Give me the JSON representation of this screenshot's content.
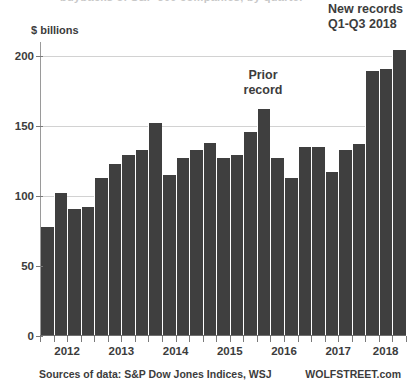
{
  "axis_unit_label": "$ billions",
  "ghost_top_text": "buybacks of S&P 500 companies, by quarter",
  "annotations": {
    "new_records": "New records\nQ1-Q3 2018",
    "new_records_line1": "New records",
    "new_records_line2": "Q1-Q3 2018",
    "prior_record_line1": "Prior",
    "prior_record_line2": "record"
  },
  "footer": {
    "sources": "Sources of data: S&P Dow Jones Indices, WSJ",
    "brand": "WOLFSTREET.com"
  },
  "colors": {
    "bar": "#3f3f3f",
    "grid": "#d2d2d2",
    "axis": "#7a7a7a",
    "text": "#3c3c3c",
    "background": "#ffffff"
  },
  "chart_data": {
    "type": "bar",
    "title": "",
    "subtitle": "",
    "xlabel": "",
    "ylabel": "$ billions",
    "ylim": [
      0,
      210
    ],
    "yticks": [
      0,
      50,
      100,
      150,
      200
    ],
    "ytick_labels": [
      "0",
      "50",
      "100",
      "150",
      "200"
    ],
    "grid": true,
    "legend": false,
    "categories": [
      "2012 Q1",
      "2012 Q2",
      "2012 Q3",
      "2012 Q4",
      "2013 Q1",
      "2013 Q2",
      "2013 Q3",
      "2013 Q4",
      "2014 Q1",
      "2014 Q2",
      "2014 Q3",
      "2014 Q4",
      "2015 Q1",
      "2015 Q2",
      "2015 Q3",
      "2015 Q4",
      "2016 Q1",
      "2016 Q2",
      "2016 Q3",
      "2016 Q4",
      "2017 Q1",
      "2017 Q2",
      "2017 Q3",
      "2017 Q4",
      "2018 Q1",
      "2018 Q2",
      "2018 Q3"
    ],
    "values": [
      78,
      102,
      91,
      92,
      113,
      123,
      129,
      133,
      152,
      115,
      127,
      133,
      138,
      127,
      129,
      146,
      162,
      127,
      113,
      135,
      135,
      117,
      133,
      137,
      189,
      191,
      204
    ],
    "x_tick_year_labels": [
      "2012",
      "2013",
      "2014",
      "2015",
      "2016",
      "2017",
      "2018"
    ],
    "annotations": [
      {
        "label": "Prior record",
        "category": "2016 Q1",
        "value": 162
      },
      {
        "label": "New records Q1-Q3 2018",
        "categories": [
          "2018 Q1",
          "2018 Q2",
          "2018 Q3"
        ],
        "values": [
          189,
          191,
          204
        ]
      }
    ]
  }
}
